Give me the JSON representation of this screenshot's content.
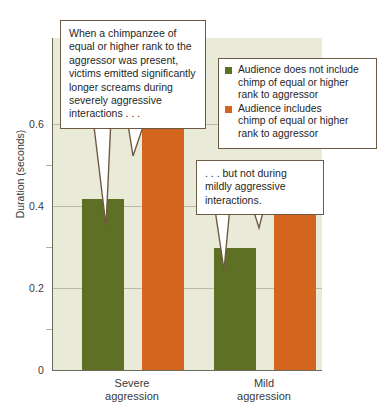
{
  "chart_data": {
    "type": "bar",
    "title": "",
    "xlabel": "",
    "ylabel": "Duration (seconds)",
    "ylim": [
      0,
      0.68
    ],
    "grid": true,
    "legend_position": "top-right",
    "categories": [
      "Severe aggression",
      "Mild aggression"
    ],
    "yticks": [
      "0",
      "0.2",
      "0.4",
      "0.6"
    ],
    "ytick_values": [
      0,
      0.2,
      0.4,
      0.6
    ],
    "minor_tick_values": [
      0.1,
      0.3,
      0.5
    ],
    "series": [
      {
        "name": "Audience does not include chimp of equal or higher rank to aggressor",
        "color": "#5e7024",
        "values": [
          0.35,
          0.25
        ]
      },
      {
        "name": "Audience includes chimp of equal or higher rank to aggressor",
        "color": "#d4651f",
        "values": [
          0.555,
          0.35
        ]
      }
    ],
    "annotations": [
      "When a chimpanzee of equal or higher rank to the aggressor was present, victims emitted significantly longer screams during severely aggressive interactions . . .",
      ". . . but not during mildly aggressive interactions."
    ]
  },
  "axes": {
    "y_label": "Duration (seconds)",
    "y_ticks": [
      {
        "label": "0.6"
      },
      {
        "label": "0.4"
      },
      {
        "label": "0.2"
      },
      {
        "label": "0"
      }
    ],
    "x_ticks": [
      {
        "line1": "Severe",
        "line2": "aggression"
      },
      {
        "line1": "Mild",
        "line2": "aggression"
      }
    ]
  },
  "legend": {
    "entries": [
      {
        "swatch_color": "#5e7024",
        "line1": "Audience does not include",
        "line2": "chimp of equal or higher",
        "line3": "rank to aggressor"
      },
      {
        "swatch_color": "#d4651f",
        "line1": "Audience includes",
        "line2": "chimp of equal or higher",
        "line3": "rank to aggressor"
      }
    ]
  },
  "callouts": [
    {
      "id": "severe-callout",
      "text": "When a chimpanzee of equal or higher rank to the aggressor was present, victims emitted significantly longer screams during severely aggressive interactions . . ."
    },
    {
      "id": "mild-callout",
      "text": ". . . but not during mildly aggressive interactions."
    }
  ],
  "colors": {
    "series_green": "#5e7024",
    "series_orange": "#d4651f",
    "plot_background": "#eaead9",
    "callout_border": "#6e5a43",
    "gridline": "#b9b9a4"
  }
}
